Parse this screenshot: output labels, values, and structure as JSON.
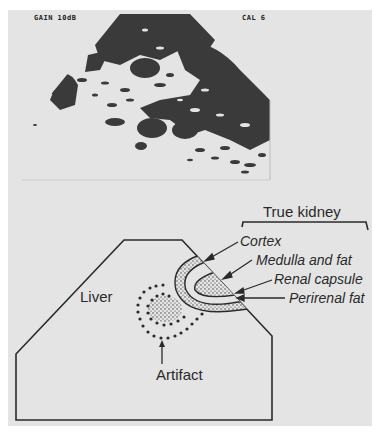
{
  "figure": {
    "background_color": "#e4e4e4",
    "ink_color": "#2a2a2a",
    "ultrasound": {
      "overlay_left": "GAIN 10dB",
      "overlay_right": "CAL 6",
      "speckle_color": "#3a3a3a"
    },
    "diagram": {
      "bracket_label": "True kidney",
      "labels": {
        "liver": "Liver",
        "artifact": "Artifact",
        "cortex": "Cortex",
        "medulla": "Medulla and fat",
        "capsule": "Renal capsule",
        "perirenal": "Perirenal fat"
      }
    }
  }
}
